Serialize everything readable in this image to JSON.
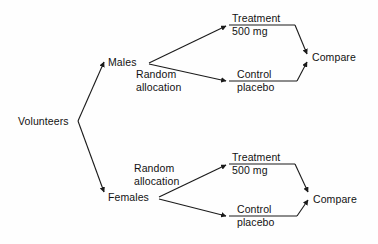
{
  "diagram": {
    "type": "flow-tree",
    "line_color": "#1a1a1a",
    "background_color": "#fefefe",
    "text_color": "#121212",
    "nodes": {
      "root": {
        "label": "Volunteers"
      },
      "block_males": {
        "label": "Males"
      },
      "block_females": {
        "label": "Females"
      },
      "males_random": {
        "line1": "Random",
        "line2": "allocation"
      },
      "females_random": {
        "line1": "Random",
        "line2": "allocation"
      },
      "males_treatment": {
        "line1": "Treatment",
        "line2": "500 mg"
      },
      "males_control": {
        "line1": "Control",
        "line2": "placebo"
      },
      "females_treatment": {
        "line1": "Treatment",
        "line2": "500 mg"
      },
      "females_control": {
        "line1": "Control",
        "line2": "placebo"
      },
      "males_compare": {
        "label": "Compare"
      },
      "females_compare": {
        "label": "Compare"
      }
    }
  }
}
